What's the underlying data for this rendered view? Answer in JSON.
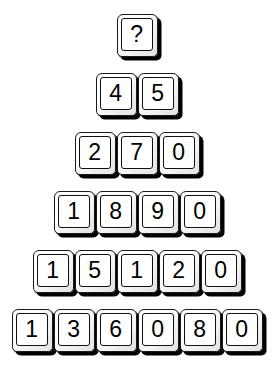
{
  "puzzle": {
    "title": "Number Pyramid",
    "type": "number-pyramid-key-grid",
    "background_color": "#ffffff",
    "key_face_color": "#ffffff",
    "key_text_color": "#000000",
    "key_shadow_color": "#000000",
    "unknown_symbol": "?",
    "rows": [
      {
        "index": 0,
        "count": 1,
        "keys": [
          "?"
        ]
      },
      {
        "index": 1,
        "count": 2,
        "keys": [
          "4",
          "5"
        ]
      },
      {
        "index": 2,
        "count": 3,
        "keys": [
          "2",
          "7",
          "0"
        ]
      },
      {
        "index": 3,
        "count": 4,
        "keys": [
          "1",
          "8",
          "9",
          "0"
        ]
      },
      {
        "index": 4,
        "count": 5,
        "keys": [
          "1",
          "5",
          "1",
          "2",
          "0"
        ]
      },
      {
        "index": 5,
        "count": 6,
        "keys": [
          "1",
          "3",
          "6",
          "0",
          "8",
          "0"
        ]
      }
    ]
  }
}
